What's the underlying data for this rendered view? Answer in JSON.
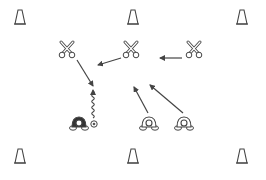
{
  "diagram": {
    "background": "#ffffff",
    "stroke_color": "#444444",
    "cones": [
      {
        "id": "cone-top-left",
        "x": 20,
        "y": 17
      },
      {
        "id": "cone-top-center",
        "x": 133,
        "y": 17
      },
      {
        "id": "cone-top-right",
        "x": 242,
        "y": 17
      },
      {
        "id": "cone-bottom-left",
        "x": 20,
        "y": 156
      },
      {
        "id": "cone-bottom-center",
        "x": 133,
        "y": 156
      },
      {
        "id": "cone-bottom-right",
        "x": 242,
        "y": 156
      }
    ],
    "defenders": [
      {
        "id": "defender-left",
        "x": 67,
        "y": 50
      },
      {
        "id": "defender-center",
        "x": 131,
        "y": 50
      },
      {
        "id": "defender-right",
        "x": 194,
        "y": 50
      }
    ],
    "attackers": [
      {
        "id": "attacker-with-ball",
        "x": 79,
        "y": 124,
        "filled": true
      },
      {
        "id": "attacker-center",
        "x": 149,
        "y": 124,
        "filled": false
      },
      {
        "id": "attacker-right",
        "x": 184,
        "y": 124,
        "filled": false
      }
    ],
    "ball": {
      "x": 94,
      "y": 124
    },
    "arrows": [
      {
        "id": "pass-right-to-center",
        "type": "pass",
        "x1": 182,
        "y1": 58,
        "x2": 160,
        "y2": 58
      },
      {
        "id": "pass-center-to-middle",
        "type": "pass",
        "x1": 121,
        "y1": 58,
        "x2": 98,
        "y2": 65
      },
      {
        "id": "run-left-defender",
        "type": "run",
        "x1": 77,
        "y1": 60,
        "x2": 93,
        "y2": 86
      },
      {
        "id": "run-attacker-center",
        "type": "run",
        "x1": 148,
        "y1": 113,
        "x2": 134,
        "y2": 87
      },
      {
        "id": "run-attacker-right",
        "type": "run",
        "x1": 183,
        "y1": 113,
        "x2": 150,
        "y2": 85
      }
    ],
    "dribble": {
      "id": "dribble-path",
      "x": 93,
      "y_start": 118,
      "y_end": 90
    }
  }
}
